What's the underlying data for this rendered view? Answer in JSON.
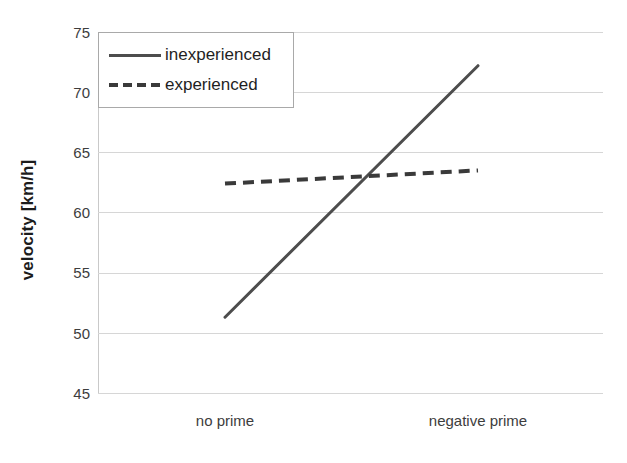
{
  "chart_data": {
    "type": "line",
    "title": "",
    "xlabel": "",
    "ylabel": "velocity [km/h]",
    "categories": [
      "no prime",
      "negative prime"
    ],
    "ylim": [
      45,
      75
    ],
    "yticks": [
      45,
      50,
      55,
      60,
      65,
      70,
      75
    ],
    "grid": true,
    "legend_position": "top-left",
    "series": [
      {
        "name": "inexperienced",
        "style": "solid",
        "color": "#4d4d4d",
        "values": [
          51.3,
          72.2
        ]
      },
      {
        "name": "experienced",
        "style": "dashed",
        "color": "#3a3a3a",
        "values": [
          62.4,
          63.5
        ]
      }
    ]
  },
  "axis": {
    "y_title": "velocity [km/h]",
    "y_tick_labels": [
      "75",
      "70",
      "65",
      "60",
      "55",
      "50",
      "45"
    ],
    "x_tick_labels": [
      "no prime",
      "negative prime"
    ]
  },
  "legend": {
    "items": [
      {
        "label": "inexperienced",
        "style": "solid"
      },
      {
        "label": "experienced",
        "style": "dashed"
      }
    ]
  },
  "colors": {
    "series_line": "#4d4d4d",
    "gridline": "#d6d6d6",
    "legend_border": "#a9a9a9",
    "text": "#3d3d3d",
    "background": "#ffffff"
  }
}
